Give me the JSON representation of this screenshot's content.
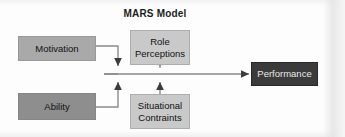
{
  "diagram": {
    "title": "MARS Model",
    "background_color": "#fdfdfd",
    "nodes": [
      {
        "id": "motivation",
        "label": "Motivation",
        "fill": "#a9a9a9",
        "text_color": "#111111"
      },
      {
        "id": "ability",
        "label": "Ability",
        "fill": "#8e8e8e",
        "text_color": "#111111"
      },
      {
        "id": "role_perceptions",
        "label_line1": "Role",
        "label_line2": "Perceptions",
        "fill": "#c9c9c9",
        "text_color": "#111111"
      },
      {
        "id": "situational_constraints",
        "label_line1": "Situational",
        "label_line2": "Contraints",
        "fill": "#c9c9c9",
        "text_color": "#111111"
      },
      {
        "id": "performance",
        "label": "Performance",
        "fill": "#3b3b3b",
        "text_color": "#e8e8e8"
      }
    ],
    "connectors": [
      {
        "from": "motivation",
        "to": "main_junction",
        "style": "elbow-right-down",
        "arrowhead": "down"
      },
      {
        "from": "ability",
        "to": "main_junction",
        "style": "elbow-right-up",
        "arrowhead": "up"
      },
      {
        "from": "role_perceptions",
        "to": "mid_junction",
        "style": "straight-down",
        "arrowhead": "down"
      },
      {
        "from": "situational_constraints",
        "to": "mid_junction",
        "style": "straight-up",
        "arrowhead": "up"
      },
      {
        "from": "main_junction",
        "to": "performance",
        "style": "straight-right",
        "arrowhead": "right"
      }
    ],
    "line_color": "#8a8a8a",
    "arrow_color": "#3c3c3c"
  }
}
